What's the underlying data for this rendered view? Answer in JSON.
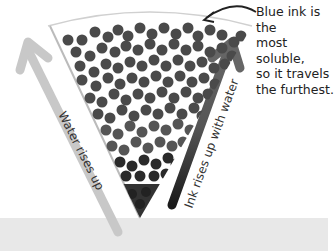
{
  "diagram": {
    "callout": "Blue ink is the\nmost soluble,\nso it travels\nthe furthest.",
    "left_arrow_label": "Water rises up",
    "right_arrow_label": "Ink rises up with water",
    "colors": {
      "background": "#ffffff",
      "ground": "#e8e8e8",
      "dots": "#4a4a4a",
      "left_arrow": "#c4c4c4",
      "right_arrow": "#333333"
    }
  }
}
